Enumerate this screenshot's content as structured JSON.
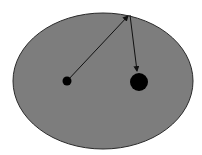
{
  "diagram": {
    "type": "ellipse-reflection",
    "colors": {
      "background": "#ffffff",
      "ellipse_fill": "#7d7d7d",
      "ellipse_stroke": "#2a2a2a",
      "focus_fill": "#000000",
      "arrow": "#111111"
    },
    "ellipse": {
      "cx": 103,
      "cy": 81,
      "rx": 90,
      "ry": 68
    },
    "small_focus": {
      "cx": 67,
      "cy": 81,
      "r": 4.5
    },
    "large_focus": {
      "cx": 139,
      "cy": 82,
      "r": 9
    },
    "reflection_point": {
      "x": 129,
      "y": 14
    }
  }
}
